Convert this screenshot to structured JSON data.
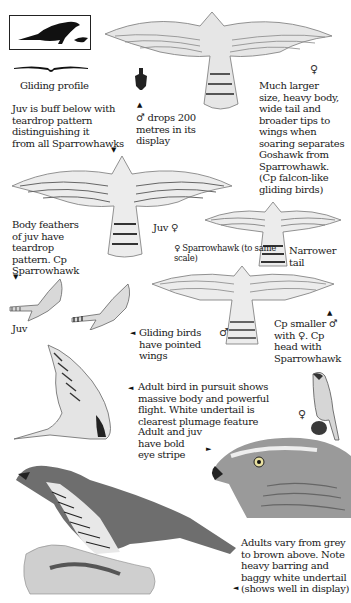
{
  "silhouette_box": {
    "label": "Gliding profile"
  },
  "annotations": {
    "juv_buff": [
      "Juv is buff below with",
      "teardrop pattern",
      "distinguishing it",
      "from all Sparrowhawks"
    ],
    "male_drops": [
      "♂ drops 200",
      "metres in its",
      "display"
    ],
    "much_larger": [
      "Much larger",
      "size, heavy body,",
      "wide tail and",
      "broader tips to",
      "wings when",
      "soaring separates",
      "Goshawk from",
      "Sparrowhawk.",
      "(Cp falcon-like",
      "gliding birds)"
    ],
    "body_feathers": [
      "Body feathers",
      "of juv have",
      "teardrop",
      "pattern. Cp",
      "Sparrowhawk"
    ],
    "juv_female": "Juv ♀",
    "sparrowhawk_scale": [
      "♀ Sparrowhawk (to same",
      "scale)"
    ],
    "narrower_tail": [
      "Narrower",
      "tail"
    ],
    "juv_label": "Juv",
    "gliding_birds": [
      "Gliding birds",
      "have pointed",
      "wings"
    ],
    "male_symbol": "♂",
    "cp_smaller": [
      "Cp smaller ♂",
      "with ♀. Cp",
      "head with",
      "Sparrowhawk"
    ],
    "adult_pursuit": [
      "Adult bird in pursuit shows",
      "massive body and powerful",
      "flight. White undertail is",
      "clearest plumage feature"
    ],
    "perched_female": "♀",
    "eye_stripe": [
      "Adult and juv",
      "have bold",
      "eye stripe"
    ],
    "adults_vary": [
      "Adults vary from grey",
      "to brown above. Note",
      "heavy barring and",
      "baggy white undertail",
      "(shows well in display)"
    ],
    "top_female": "♀"
  },
  "arrows": {
    "down": "▼",
    "up": "▲",
    "left": "◄",
    "right": "►"
  },
  "colors": {
    "ink": "#1a1a1a",
    "feather": "#8a8a8a",
    "feather_light": "#d8d8d8"
  }
}
